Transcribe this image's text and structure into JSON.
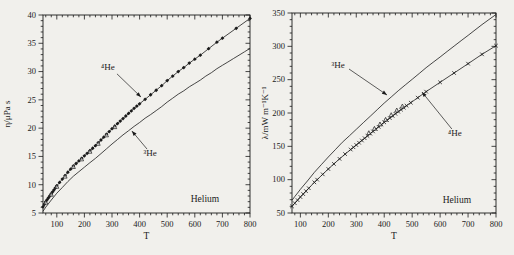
{
  "page": {
    "background": "#f1f0ec",
    "ink": "#1b1b1b"
  },
  "chart_data": [
    {
      "id": "viscosity",
      "type": "line+scatter",
      "xlabel": "T",
      "ylabel": "η/μPa s",
      "corner_label": "Helium",
      "corner_label_at": [
        637,
        7.5
      ],
      "xlim": [
        50,
        800
      ],
      "ylim": [
        5,
        40
      ],
      "xticks": [
        100,
        200,
        300,
        400,
        500,
        600,
        700,
        800
      ],
      "xminor": 20,
      "yticks": [
        5,
        10,
        15,
        20,
        25,
        30,
        35,
        40
      ],
      "yminor": 1,
      "legend": "none",
      "grid": false,
      "series": [
        {
          "name": "4He-data",
          "label": "⁴He",
          "marker": "diamond",
          "line": true,
          "points": [
            [
              50,
              6.1
            ],
            [
              55,
              6.55
            ],
            [
              60,
              7.0
            ],
            [
              65,
              7.35
            ],
            [
              70,
              7.7
            ],
            [
              75,
              8.05
            ],
            [
              80,
              8.4
            ],
            [
              85,
              8.75
            ],
            [
              90,
              9.1
            ],
            [
              95,
              9.45
            ],
            [
              100,
              9.8
            ],
            [
              110,
              10.4
            ],
            [
              120,
              11.0
            ],
            [
              130,
              11.6
            ],
            [
              140,
              12.2
            ],
            [
              150,
              12.75
            ],
            [
              160,
              13.3
            ],
            [
              170,
              13.75
            ],
            [
              180,
              14.2
            ],
            [
              190,
              14.65
            ],
            [
              200,
              15.1
            ],
            [
              210,
              15.55
            ],
            [
              220,
              16.0
            ],
            [
              230,
              16.45
            ],
            [
              240,
              16.9
            ],
            [
              250,
              17.4
            ],
            [
              260,
              17.9
            ],
            [
              270,
              18.4
            ],
            [
              280,
              18.9
            ],
            [
              290,
              19.4
            ],
            [
              300,
              19.9
            ],
            [
              310,
              20.35
            ],
            [
              320,
              20.8
            ],
            [
              330,
              21.25
            ],
            [
              340,
              21.7
            ],
            [
              350,
              22.15
            ],
            [
              360,
              22.6
            ],
            [
              370,
              23.05
            ],
            [
              380,
              23.5
            ],
            [
              390,
              23.9
            ],
            [
              400,
              24.3
            ],
            [
              420,
              25.1
            ],
            [
              440,
              25.9
            ],
            [
              460,
              26.7
            ],
            [
              480,
              27.5
            ],
            [
              500,
              28.4
            ],
            [
              520,
              29.2
            ],
            [
              540,
              30.0
            ],
            [
              560,
              30.7
            ],
            [
              580,
              31.5
            ],
            [
              600,
              32.2
            ],
            [
              620,
              32.9
            ],
            [
              650,
              34.05
            ],
            [
              680,
              35.2
            ],
            [
              700,
              35.9
            ],
            [
              750,
              37.65
            ],
            [
              800,
              39.4
            ]
          ]
        },
        {
          "name": "4He-data-secondary",
          "label": "⁴He",
          "marker": "triangle-open",
          "line": false,
          "points": [
            [
              60,
              6.85
            ],
            [
              80,
              8.25
            ],
            [
              100,
              9.65
            ],
            [
              130,
              11.45
            ],
            [
              160,
              13.15
            ],
            [
              190,
              14.5
            ],
            [
              220,
              15.85
            ],
            [
              250,
              17.25
            ],
            [
              280,
              18.75
            ],
            [
              310,
              20.2
            ]
          ]
        },
        {
          "name": "3He-correlation",
          "label": "³He",
          "marker": "none",
          "line": true,
          "points": [
            [
              50,
              5.3
            ],
            [
              60,
              6.05
            ],
            [
              80,
              7.3
            ],
            [
              100,
              8.5
            ],
            [
              120,
              9.5
            ],
            [
              140,
              10.55
            ],
            [
              160,
              11.5
            ],
            [
              180,
              12.3
            ],
            [
              200,
              13.1
            ],
            [
              220,
              13.9
            ],
            [
              240,
              14.65
            ],
            [
              260,
              15.5
            ],
            [
              280,
              16.35
            ],
            [
              300,
              17.2
            ],
            [
              320,
              18.0
            ],
            [
              340,
              18.8
            ],
            [
              360,
              19.55
            ],
            [
              380,
              20.3
            ],
            [
              400,
              21.0
            ],
            [
              420,
              21.75
            ],
            [
              440,
              22.4
            ],
            [
              460,
              23.1
            ],
            [
              480,
              23.8
            ],
            [
              500,
              24.6
            ],
            [
              520,
              25.3
            ],
            [
              540,
              26.0
            ],
            [
              560,
              26.6
            ],
            [
              580,
              27.3
            ],
            [
              600,
              27.9
            ],
            [
              620,
              28.5
            ],
            [
              640,
              29.2
            ],
            [
              660,
              29.8
            ],
            [
              680,
              30.5
            ],
            [
              700,
              31.1
            ],
            [
              720,
              31.7
            ],
            [
              740,
              32.3
            ],
            [
              760,
              32.9
            ],
            [
              780,
              33.5
            ],
            [
              800,
              34.1
            ]
          ]
        }
      ],
      "annotations": [
        {
          "text": "⁴He",
          "text_at": [
            285,
            30.8
          ],
          "arrow_from": [
            318,
            29.6
          ],
          "arrow_to": [
            405,
            25.5
          ]
        },
        {
          "text": "³He",
          "text_at": [
            438,
            15.6
          ],
          "arrow_from": [
            427,
            16.3
          ],
          "arrow_to": [
            372,
            19.5
          ]
        }
      ]
    },
    {
      "id": "thermal-conductivity",
      "type": "line+scatter",
      "xlabel": "T",
      "ylabel": "λ/mW m⁻¹K⁻¹",
      "corner_label": "Helium",
      "corner_label_at": [
        660,
        69.5
      ],
      "xlim": [
        70,
        800
      ],
      "ylim": [
        50,
        350
      ],
      "xticks": [
        100,
        200,
        300,
        400,
        500,
        600,
        700,
        800
      ],
      "xminor": 20,
      "yticks": [
        50,
        100,
        150,
        200,
        250,
        300,
        350
      ],
      "yminor": 10,
      "legend": "none",
      "grid": false,
      "series": [
        {
          "name": "3He-correlation",
          "label": "³He",
          "marker": "none",
          "line": true,
          "points": [
            [
              70,
              69
            ],
            [
              80,
              74.7
            ],
            [
              90,
              80
            ],
            [
              100,
              85.5
            ],
            [
              125,
              98
            ],
            [
              150,
              111
            ],
            [
              175,
              122.5
            ],
            [
              200,
              134
            ],
            [
              225,
              145
            ],
            [
              250,
              156
            ],
            [
              275,
              165.7
            ],
            [
              300,
              175.5
            ],
            [
              325,
              185.4
            ],
            [
              350,
              195
            ],
            [
              375,
              205
            ],
            [
              400,
              214.8
            ],
            [
              425,
              224
            ],
            [
              450,
              233.3
            ],
            [
              475,
              242
            ],
            [
              500,
              250.6
            ],
            [
              525,
              259.3
            ],
            [
              550,
              268
            ],
            [
              575,
              276
            ],
            [
              600,
              284
            ],
            [
              625,
              292.2
            ],
            [
              650,
              300.3
            ],
            [
              675,
              308.4
            ],
            [
              700,
              316.4
            ],
            [
              725,
              324.5
            ],
            [
              750,
              332.6
            ],
            [
              775,
              340.2
            ],
            [
              800,
              347.7
            ]
          ]
        },
        {
          "name": "4He-data",
          "label": "⁴He",
          "marker": "cross",
          "line": true,
          "points": [
            [
              70,
              60
            ],
            [
              80,
              64.7
            ],
            [
              90,
              69.3
            ],
            [
              100,
              74
            ],
            [
              110,
              78.4
            ],
            [
              120,
              82.8
            ],
            [
              130,
              87.2
            ],
            [
              150,
              96
            ],
            [
              160,
              100
            ],
            [
              180,
              108
            ],
            [
              200,
              116
            ],
            [
              220,
              123.6
            ],
            [
              240,
              131.2
            ],
            [
              260,
              138.4
            ],
            [
              280,
              145.2
            ],
            [
              290,
              148.6
            ],
            [
              300,
              152
            ],
            [
              310,
              155.4
            ],
            [
              320,
              158.8
            ],
            [
              330,
              162.2
            ],
            [
              340,
              165.6
            ],
            [
              350,
              169
            ],
            [
              360,
              172.4
            ],
            [
              370,
              175.8
            ],
            [
              380,
              179.2
            ],
            [
              390,
              182.6
            ],
            [
              400,
              186
            ],
            [
              410,
              189.2
            ],
            [
              420,
              192.4
            ],
            [
              430,
              195.6
            ],
            [
              440,
              198.8
            ],
            [
              450,
              202
            ],
            [
              460,
              205
            ],
            [
              470,
              208
            ],
            [
              480,
              211
            ],
            [
              495,
              215.5
            ],
            [
              520,
              223
            ],
            [
              550,
              232
            ],
            [
              600,
              246
            ],
            [
              650,
              260
            ],
            [
              700,
              274
            ],
            [
              750,
              288
            ],
            [
              800,
              301
            ]
          ]
        },
        {
          "name": "4He-data-secondary",
          "label": "⁴He",
          "marker": "triangle-open",
          "line": false,
          "points": [
            [
              345,
              170
            ],
            [
              365,
              176.5
            ],
            [
              385,
              183
            ],
            [
              405,
              190
            ],
            [
              425,
              197
            ],
            [
              445,
              204
            ],
            [
              465,
              210
            ]
          ]
        }
      ],
      "annotations": [
        {
          "text": "³He",
          "text_at": [
            235,
            272
          ],
          "arrow_from": [
            274,
            266
          ],
          "arrow_to": [
            410,
            227
          ]
        },
        {
          "text": "⁴He",
          "text_at": [
            653,
            170
          ],
          "arrow_from": [
            642,
            176
          ],
          "arrow_to": [
            535,
            231.5
          ]
        }
      ]
    }
  ]
}
